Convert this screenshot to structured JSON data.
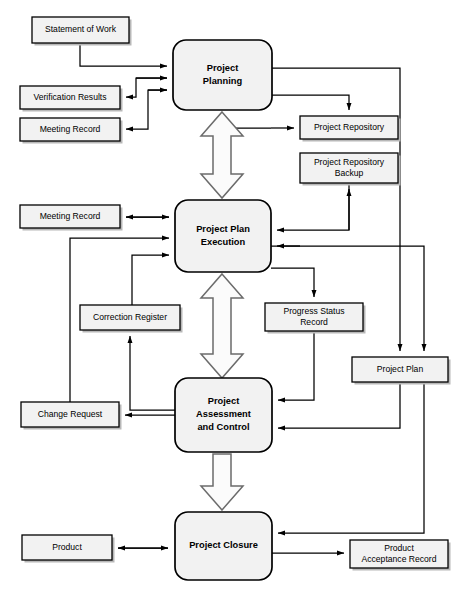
{
  "diagram": {
    "type": "flowchart",
    "processes": [
      {
        "id": "project-planning",
        "label_lines": [
          "Project",
          "Planning"
        ],
        "x": 173,
        "y": 40,
        "w": 99,
        "h": 70
      },
      {
        "id": "project-plan-execution",
        "label_lines": [
          "Project Plan",
          "Execution"
        ],
        "x": 175,
        "y": 200,
        "w": 96,
        "h": 72
      },
      {
        "id": "project-assessment-control",
        "label_lines": [
          "Project",
          "Assessment",
          "and Control"
        ],
        "x": 175,
        "y": 378,
        "w": 97,
        "h": 74
      },
      {
        "id": "project-closure",
        "label_lines": [
          "Project Closure"
        ],
        "x": 175,
        "y": 512,
        "w": 97,
        "h": 68
      }
    ],
    "artifacts": [
      {
        "id": "statement-of-work",
        "label_lines": [
          "Statement of Work"
        ],
        "x": 32,
        "y": 17,
        "w": 97,
        "h": 26
      },
      {
        "id": "verification-results",
        "label_lines": [
          "Verification Results"
        ],
        "x": 20,
        "y": 86,
        "w": 100,
        "h": 23
      },
      {
        "id": "meeting-record-top",
        "label_lines": [
          "Meeting Record"
        ],
        "x": 20,
        "y": 118,
        "w": 100,
        "h": 23
      },
      {
        "id": "project-repository",
        "label_lines": [
          "Project Repository"
        ],
        "x": 300,
        "y": 116,
        "w": 98,
        "h": 23
      },
      {
        "id": "project-repository-backup",
        "label_lines": [
          "Project Repository",
          "Backup"
        ],
        "x": 300,
        "y": 153,
        "w": 98,
        "h": 30
      },
      {
        "id": "meeting-record-mid",
        "label_lines": [
          "Meeting Record"
        ],
        "x": 20,
        "y": 205,
        "w": 100,
        "h": 23
      },
      {
        "id": "correction-register",
        "label_lines": [
          "Correction Register"
        ],
        "x": 80,
        "y": 305,
        "w": 100,
        "h": 25
      },
      {
        "id": "progress-status-record",
        "label_lines": [
          "Progress Status",
          "Record"
        ],
        "x": 265,
        "y": 303,
        "w": 98,
        "h": 28
      },
      {
        "id": "project-plan",
        "label_lines": [
          "Project Plan"
        ],
        "x": 352,
        "y": 357,
        "w": 96,
        "h": 25
      },
      {
        "id": "change-request",
        "label_lines": [
          "Change Request"
        ],
        "x": 21,
        "y": 402,
        "w": 98,
        "h": 25
      },
      {
        "id": "product",
        "label_lines": [
          "Product"
        ],
        "x": 22,
        "y": 535,
        "w": 90,
        "h": 25
      },
      {
        "id": "product-acceptance-record",
        "label_lines": [
          "Product",
          "Acceptance Record"
        ],
        "x": 350,
        "y": 540,
        "w": 98,
        "h": 28
      }
    ],
    "colors": {
      "shape_fill": "#f2f2f2",
      "shape_stroke": "#000000",
      "connector": "#000000",
      "block_arrow_fill": "#fbfbfb",
      "block_arrow_stroke": "#6b6b6b",
      "background": "#ffffff"
    },
    "flows": [
      {
        "id": "flow-sow-to-planning",
        "from": "statement-of-work",
        "to": "project-planning"
      },
      {
        "id": "flow-planning-to-verification",
        "from": "project-planning",
        "to": "verification-results"
      },
      {
        "id": "flow-planning-to-meeting-record-top",
        "from": "project-planning",
        "to": "meeting-record-top"
      },
      {
        "id": "flow-planning-to-repository",
        "from": "project-planning",
        "to": "project-repository"
      },
      {
        "id": "flow-planning-to-project-plan",
        "from": "project-planning",
        "to": "project-plan"
      },
      {
        "id": "flow-planning-execution-bidirectional",
        "from": "project-planning",
        "to": "project-plan-execution"
      },
      {
        "id": "flow-execution-to-repository",
        "from": "project-plan-execution",
        "to": "project-repository"
      },
      {
        "id": "flow-backup-to-execution",
        "from": "project-repository-backup",
        "to": "project-plan-execution"
      },
      {
        "id": "flow-execution-to-meeting-record-mid",
        "from": "project-plan-execution",
        "to": "meeting-record-mid"
      },
      {
        "id": "flow-execution-to-progress-status",
        "from": "project-plan-execution",
        "to": "progress-status-record"
      },
      {
        "id": "flow-execution-to-project-plan",
        "from": "project-plan-execution",
        "to": "project-plan"
      },
      {
        "id": "flow-execution-assessment-bidirectional",
        "from": "project-plan-execution",
        "to": "project-assessment-control"
      },
      {
        "id": "flow-change-request-to-execution",
        "from": "change-request",
        "to": "project-plan-execution"
      },
      {
        "id": "flow-correction-register-to-execution",
        "from": "correction-register",
        "to": "project-plan-execution"
      },
      {
        "id": "flow-assessment-to-correction-register",
        "from": "project-assessment-control",
        "to": "correction-register"
      },
      {
        "id": "flow-assessment-to-change-request",
        "from": "project-assessment-control",
        "to": "change-request"
      },
      {
        "id": "flow-progress-status-to-assessment",
        "from": "progress-status-record",
        "to": "project-assessment-control"
      },
      {
        "id": "flow-project-plan-to-assessment",
        "from": "project-plan",
        "to": "project-assessment-control"
      },
      {
        "id": "flow-assessment-closure-arrow",
        "from": "project-assessment-control",
        "to": "project-closure"
      },
      {
        "id": "flow-closure-to-product",
        "from": "project-closure",
        "to": "product"
      },
      {
        "id": "flow-closure-to-acceptance-record",
        "from": "project-closure",
        "to": "product-acceptance-record"
      },
      {
        "id": "flow-project-plan-to-closure",
        "from": "project-plan",
        "to": "project-closure"
      }
    ]
  }
}
